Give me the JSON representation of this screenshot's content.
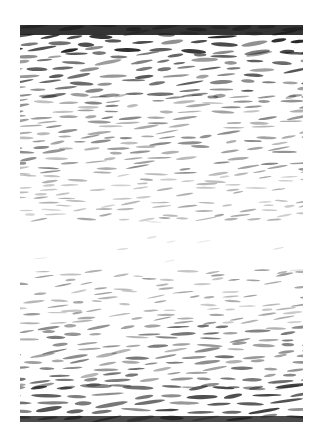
{
  "image": {
    "description": "grayscale print of dense horizontal dash/brushstroke marks, dark at top and bottom edges, fading to a nearly blank white band just below the middle",
    "background": "#ffffff",
    "frame": {
      "x": 20,
      "y": 25,
      "width": 283,
      "height": 397
    },
    "ink_color": "#1e1e1e",
    "bands": [
      {
        "y0": 0,
        "y1": 28,
        "density": 1.0,
        "darkness": 0.95,
        "stroke_len": 22,
        "stroke_w": 4.5
      },
      {
        "y0": 28,
        "y1": 70,
        "density": 0.9,
        "darkness": 0.75,
        "stroke_len": 20,
        "stroke_w": 4
      },
      {
        "y0": 70,
        "y1": 150,
        "density": 0.75,
        "darkness": 0.55,
        "stroke_len": 18,
        "stroke_w": 3
      },
      {
        "y0": 150,
        "y1": 195,
        "density": 0.55,
        "darkness": 0.4,
        "stroke_len": 16,
        "stroke_w": 2.5
      },
      {
        "y0": 195,
        "y1": 245,
        "density": 0.05,
        "darkness": 0.2,
        "stroke_len": 12,
        "stroke_w": 2
      },
      {
        "y0": 245,
        "y1": 300,
        "density": 0.55,
        "darkness": 0.45,
        "stroke_len": 16,
        "stroke_w": 2.5
      },
      {
        "y0": 300,
        "y1": 360,
        "density": 0.8,
        "darkness": 0.65,
        "stroke_len": 19,
        "stroke_w": 3.5
      },
      {
        "y0": 360,
        "y1": 397,
        "density": 1.0,
        "darkness": 0.85,
        "stroke_len": 24,
        "stroke_w": 4.5
      }
    ],
    "top_fill": {
      "height": 10,
      "opacity": 0.9
    },
    "bottom_fill": {
      "height": 6,
      "opacity": 0.8
    },
    "seed": 7
  }
}
